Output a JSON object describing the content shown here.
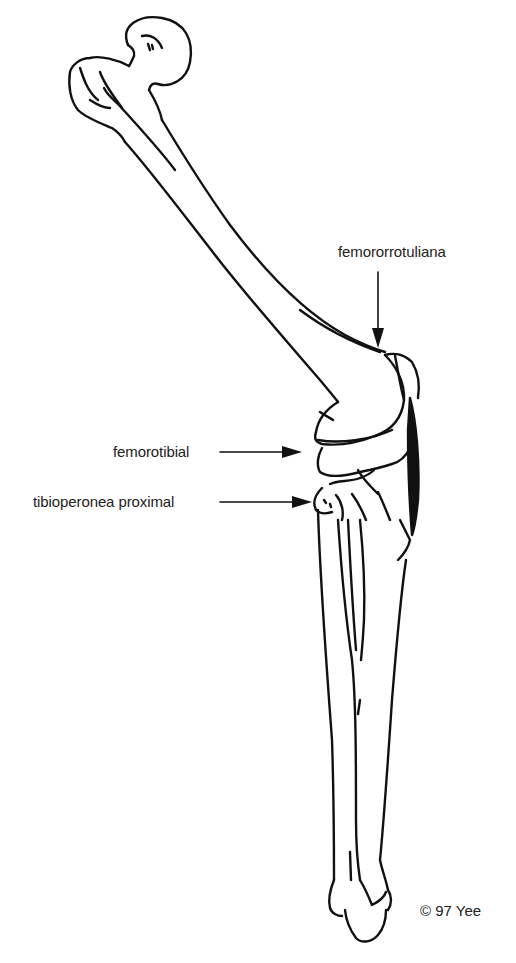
{
  "diagram": {
    "labels": [
      {
        "id": "femororrotuliana",
        "text": "femororrotuliana",
        "points_to": "patellofemoral joint"
      },
      {
        "id": "femorotibial",
        "text": "femorotibial",
        "points_to": "femorotibial joint"
      },
      {
        "id": "tibioperonea",
        "text": "tibioperonea proximal",
        "points_to": "proximal tibiofibular joint"
      }
    ],
    "copyright": "© 97 Yee",
    "colors": {
      "ink": "#111111",
      "background": "#ffffff",
      "text": "#222222"
    }
  }
}
